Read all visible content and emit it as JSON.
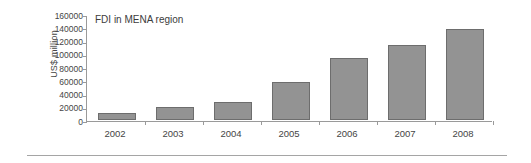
{
  "chart_data": {
    "type": "bar",
    "title": "FDI in MENA region",
    "xlabel": "",
    "ylabel": "US$ million",
    "categories": [
      "2002",
      "2003",
      "2004",
      "2005",
      "2006",
      "2007",
      "2008"
    ],
    "values": [
      10500,
      20000,
      27000,
      57000,
      94000,
      113000,
      138000
    ],
    "series": [
      {
        "name": "FDI in MENA region",
        "values": [
          10500,
          20000,
          27000,
          57000,
          94000,
          113000,
          138000
        ]
      }
    ],
    "ylim": [
      0,
      160000
    ],
    "y_ticks": [
      0,
      20000,
      40000,
      60000,
      80000,
      100000,
      120000,
      140000,
      160000
    ],
    "y_tick_labels": [
      "0",
      "20000",
      "40000",
      "60000",
      "80000",
      "100000",
      "120000",
      "140000",
      "160000"
    ],
    "grid": false,
    "legend": false,
    "legend_position": "none",
    "bar_color": "#939393",
    "bar_border_color": "#6d6d6d",
    "axis_color": "#9a9a9a",
    "text_color": "#454545",
    "background": "#ffffff"
  }
}
